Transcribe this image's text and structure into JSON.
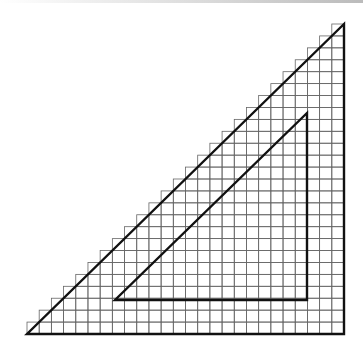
{
  "diagram": {
    "grid": {
      "origin_x": 29,
      "baseline_y": 334,
      "cell": 12.2,
      "columns": 26,
      "line_color": "#555555"
    },
    "outer_triangle": {
      "vertices": [
        [
          27,
          334
        ],
        [
          344,
          334
        ],
        [
          344,
          24
        ]
      ],
      "stroke": "#111111"
    },
    "inner_triangle": {
      "vertices": [
        [
          115,
          300
        ],
        [
          307,
          300
        ],
        [
          307,
          113
        ]
      ],
      "stroke": "#111111"
    },
    "colors": {
      "background": "#ffffff",
      "grid": "#666666",
      "lines": "#111111"
    }
  }
}
